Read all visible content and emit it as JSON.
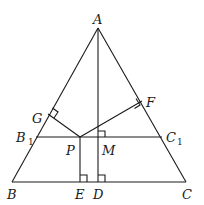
{
  "diagram": {
    "type": "geometry",
    "points": {
      "A": {
        "label": "A",
        "x": 98,
        "y": 28
      },
      "B": {
        "label": "B",
        "x": 12,
        "y": 182
      },
      "C": {
        "label": "C",
        "x": 186,
        "y": 182
      },
      "D": {
        "label": "D",
        "x": 98,
        "y": 182
      },
      "E": {
        "label": "E",
        "x": 80,
        "y": 182
      },
      "P": {
        "label": "P",
        "x": 80,
        "y": 137
      },
      "M": {
        "label": "M",
        "x": 98,
        "y": 137
      },
      "B1": {
        "label": "B",
        "sub": "1",
        "x": 36,
        "y": 137
      },
      "C1": {
        "label": "C",
        "sub": "1",
        "x": 162,
        "y": 137
      },
      "G": {
        "label": "G",
        "x": 48,
        "y": 114
      },
      "F": {
        "label": "F",
        "x": 142,
        "y": 101
      }
    },
    "segments": [
      "AB",
      "AC",
      "BC",
      "AD",
      "B1C1",
      "PG",
      "PF",
      "PE"
    ],
    "right_angles": [
      "G",
      "F",
      "M",
      "E",
      "D"
    ]
  }
}
